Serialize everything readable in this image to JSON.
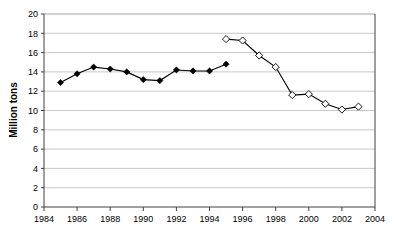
{
  "chart_data": {
    "type": "line",
    "title": "",
    "xlabel": "",
    "ylabel": "Million tons",
    "xlim": [
      1984,
      2004
    ],
    "ylim": [
      0,
      20
    ],
    "ytick_step": 2,
    "xtick_step": 2,
    "grid": "horizontal",
    "legend": "none",
    "xticks": [
      "1984",
      "1986",
      "1988",
      "1990",
      "1992",
      "1994",
      "1996",
      "1998",
      "2000",
      "2002",
      "2004"
    ],
    "yticks": [
      "0",
      "2",
      "4",
      "6",
      "8",
      "10",
      "12",
      "14",
      "16",
      "18",
      "20"
    ],
    "series": [
      {
        "name": "historical-filled-diamond",
        "marker": "filled-diamond",
        "x": [
          1985,
          1986,
          1987,
          1988,
          1989,
          1990,
          1991,
          1992,
          1993,
          1994,
          1995
        ],
        "values": [
          12.9,
          13.8,
          14.5,
          14.3,
          14.0,
          13.2,
          13.1,
          14.2,
          14.1,
          14.1,
          14.8
        ]
      },
      {
        "name": "later-open-diamond",
        "marker": "open-diamond",
        "x": [
          1995,
          1996,
          1997,
          1998,
          1999,
          2000,
          2001,
          2002,
          2003
        ],
        "values": [
          17.4,
          17.25,
          15.7,
          14.5,
          11.6,
          11.7,
          10.7,
          10.1,
          10.4
        ]
      }
    ]
  },
  "axes": {
    "y_title": "Million tons"
  },
  "colors": {
    "grid": "#b0b0b0",
    "axis": "#404040",
    "line": "#000000",
    "marker_fill_open": "#ffffff"
  }
}
